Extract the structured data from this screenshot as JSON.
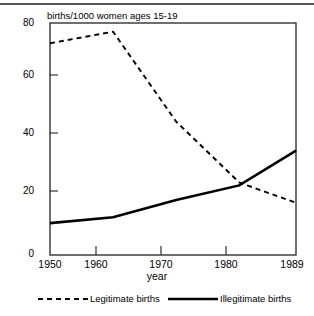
{
  "chart_data": {
    "type": "line",
    "title": "births/1000 women ages 15-19",
    "xlabel": "year",
    "ylabel": "",
    "x": [
      1950,
      1960,
      1970,
      1980,
      1989
    ],
    "xtick_labels": [
      "1950",
      "1960",
      "1970",
      "1980",
      "1989"
    ],
    "ytick_labels": [
      "0",
      "20",
      "40",
      "60",
      "80"
    ],
    "ytick_values": [
      0,
      20,
      40,
      60,
      80
    ],
    "xlim": [
      1950,
      1989
    ],
    "ylim": [
      0,
      80
    ],
    "grid": false,
    "legend_position": "below",
    "series": [
      {
        "name": "Legitimate births",
        "style": "dashed",
        "color": "#000000",
        "values": [
          73,
          77,
          46,
          25,
          18
        ]
      },
      {
        "name": "Illegitimate births",
        "style": "solid",
        "color": "#000000",
        "values": [
          11,
          13,
          19,
          24,
          36
        ]
      }
    ]
  },
  "legend": {
    "entries": [
      {
        "label": "Legitimate births",
        "style": "dashed"
      },
      {
        "label": "Illegitimate births",
        "style": "solid"
      }
    ]
  }
}
